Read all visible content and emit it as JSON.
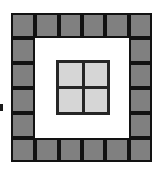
{
  "figure": {
    "canvas": {
      "width": 164,
      "height": 174,
      "background_color": "#ffffff"
    },
    "outer_ring": {
      "name": "outer-tile-ring",
      "grid_columns": 6,
      "grid_rows": 6,
      "tile_count": 20,
      "tile_fill_color": "#808080",
      "tile_border_color": "#121212",
      "tile_border_width": 2,
      "bounds": {
        "left": 11,
        "top": 13,
        "width": 141,
        "height": 149
      }
    },
    "middle_band": {
      "name": "white-middle-band",
      "fill_color": "#ffffff"
    },
    "inner_grid": {
      "name": "inner-tile-grid",
      "grid_columns": 2,
      "grid_rows": 2,
      "tile_count": 4,
      "tile_fill_color": "#d6d6d6",
      "border_color": "#262626",
      "border_width": 3,
      "bounds": {
        "left": 56,
        "top": 60,
        "width": 54,
        "height": 55
      }
    },
    "left_tick": {
      "name": "left-edge-tick",
      "color": "#1a1a1a",
      "bounds": {
        "left": 0,
        "top": 104,
        "width": 3,
        "height": 7
      }
    }
  }
}
